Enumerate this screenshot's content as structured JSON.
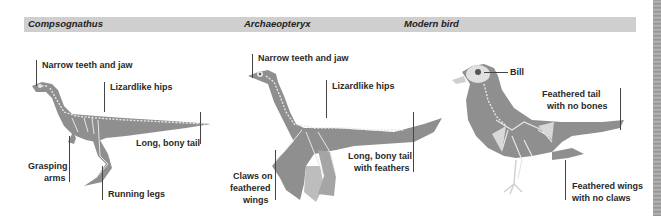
{
  "header": {
    "columns": [
      {
        "title": "Compsognathus"
      },
      {
        "title": "Archaeopteryx"
      },
      {
        "title": "Modern bird"
      }
    ]
  },
  "compsognathus": {
    "labels": {
      "jaw": "Narrow teeth and jaw",
      "hips": "Lizardlike hips",
      "tail": "Long, bony tail",
      "arms_line1": "Grasping",
      "arms_line2": "arms",
      "legs": "Running legs"
    }
  },
  "archaeopteryx": {
    "labels": {
      "jaw": "Narrow teeth and jaw",
      "hips": "Lizardlike hips",
      "tail_line1": "Long, bony tail",
      "tail_line2": "with feathers",
      "claws_line1": "Claws on",
      "claws_line2": "feathered",
      "claws_line3": "wings"
    }
  },
  "modern_bird": {
    "labels": {
      "bill": "Bill",
      "tail_line1": "Feathered tail",
      "tail_line2": "with no bones",
      "wings_line1": "Feathered wings",
      "wings_line2": "with no claws"
    }
  },
  "colors": {
    "header_bar": "#cfcfcf",
    "animal_fill": "#8f8f8f",
    "skeleton": "#e6e6e6",
    "leader_line": "#444444"
  }
}
